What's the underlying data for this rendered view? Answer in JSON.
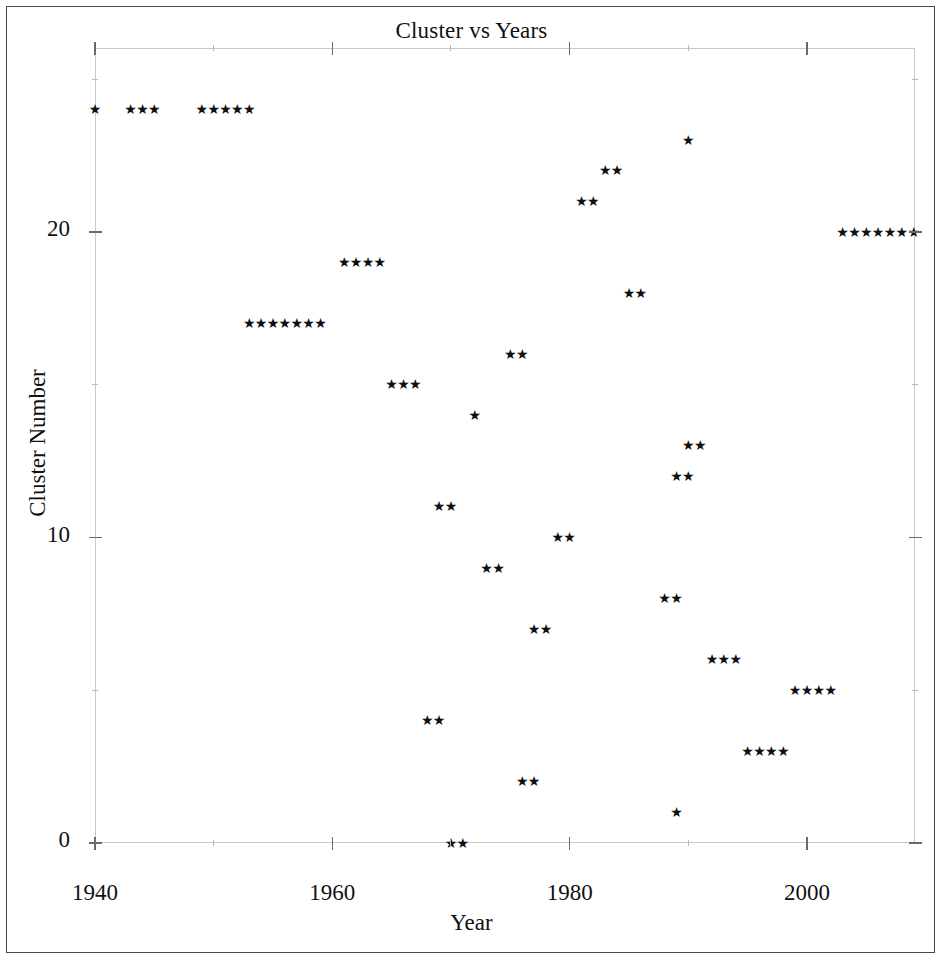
{
  "figure": {
    "title": "Cluster vs Years",
    "xlabel": "Year",
    "ylabel": "Cluster Number",
    "marker": "star-marker",
    "marker_glyph": "★",
    "marker_color": "#101010",
    "frame_color": "#c9c9c9",
    "page_border_color": "#4a4a4a"
  },
  "chart_data": {
    "type": "scatter",
    "title": "Cluster vs Years",
    "xlabel": "Year",
    "ylabel": "Cluster Number",
    "xlim": [
      1940,
      2009
    ],
    "ylim": [
      -0.7,
      25.6
    ],
    "xticks": [
      1940,
      1960,
      1980,
      2000
    ],
    "xtick_labels": [
      "1940",
      "1960",
      "1980",
      "2000"
    ],
    "xticks_minor": [
      1950,
      1970,
      1990
    ],
    "yticks": [
      0,
      10,
      20
    ],
    "ytick_labels": [
      "0",
      "10",
      "20"
    ],
    "yticks_minor": [
      5,
      15,
      25
    ],
    "grid": false,
    "legend": null,
    "marker": "star",
    "series": [
      {
        "name": "Cluster assignment by year",
        "points": [
          {
            "x": 1940,
            "y": 24
          },
          {
            "x": 1943,
            "y": 24
          },
          {
            "x": 1944,
            "y": 24
          },
          {
            "x": 1945,
            "y": 24
          },
          {
            "x": 1949,
            "y": 24
          },
          {
            "x": 1950,
            "y": 24
          },
          {
            "x": 1951,
            "y": 24
          },
          {
            "x": 1952,
            "y": 24
          },
          {
            "x": 1953,
            "y": 24
          },
          {
            "x": 1990,
            "y": 23
          },
          {
            "x": 1983,
            "y": 22
          },
          {
            "x": 1984,
            "y": 22
          },
          {
            "x": 1981,
            "y": 21
          },
          {
            "x": 1982,
            "y": 21
          },
          {
            "x": 2003,
            "y": 20
          },
          {
            "x": 2004,
            "y": 20
          },
          {
            "x": 2005,
            "y": 20
          },
          {
            "x": 2006,
            "y": 20
          },
          {
            "x": 2007,
            "y": 20
          },
          {
            "x": 2008,
            "y": 20
          },
          {
            "x": 2009,
            "y": 20
          },
          {
            "x": 1961,
            "y": 19
          },
          {
            "x": 1962,
            "y": 19
          },
          {
            "x": 1963,
            "y": 19
          },
          {
            "x": 1964,
            "y": 19
          },
          {
            "x": 1985,
            "y": 18
          },
          {
            "x": 1986,
            "y": 18
          },
          {
            "x": 1953,
            "y": 17
          },
          {
            "x": 1954,
            "y": 17
          },
          {
            "x": 1955,
            "y": 17
          },
          {
            "x": 1956,
            "y": 17
          },
          {
            "x": 1957,
            "y": 17
          },
          {
            "x": 1958,
            "y": 17
          },
          {
            "x": 1959,
            "y": 17
          },
          {
            "x": 1975,
            "y": 16
          },
          {
            "x": 1976,
            "y": 16
          },
          {
            "x": 1965,
            "y": 15
          },
          {
            "x": 1966,
            "y": 15
          },
          {
            "x": 1967,
            "y": 15
          },
          {
            "x": 1972,
            "y": 14
          },
          {
            "x": 1990,
            "y": 13
          },
          {
            "x": 1991,
            "y": 13
          },
          {
            "x": 1989,
            "y": 12
          },
          {
            "x": 1990,
            "y": 12
          },
          {
            "x": 1969,
            "y": 11
          },
          {
            "x": 1970,
            "y": 11
          },
          {
            "x": 1979,
            "y": 10
          },
          {
            "x": 1980,
            "y": 10
          },
          {
            "x": 1973,
            "y": 9
          },
          {
            "x": 1974,
            "y": 9
          },
          {
            "x": 1988,
            "y": 8
          },
          {
            "x": 1989,
            "y": 8
          },
          {
            "x": 1977,
            "y": 7
          },
          {
            "x": 1978,
            "y": 7
          },
          {
            "x": 1992,
            "y": 6
          },
          {
            "x": 1993,
            "y": 6
          },
          {
            "x": 1994,
            "y": 6
          },
          {
            "x": 1999,
            "y": 5
          },
          {
            "x": 2000,
            "y": 5
          },
          {
            "x": 2001,
            "y": 5
          },
          {
            "x": 2002,
            "y": 5
          },
          {
            "x": 1968,
            "y": 4
          },
          {
            "x": 1969,
            "y": 4
          },
          {
            "x": 1995,
            "y": 3
          },
          {
            "x": 1996,
            "y": 3
          },
          {
            "x": 1997,
            "y": 3
          },
          {
            "x": 1998,
            "y": 3
          },
          {
            "x": 1976,
            "y": 2
          },
          {
            "x": 1977,
            "y": 2
          },
          {
            "x": 1989,
            "y": 1
          },
          {
            "x": 1970,
            "y": 0
          },
          {
            "x": 1971,
            "y": 0
          }
        ]
      }
    ]
  }
}
